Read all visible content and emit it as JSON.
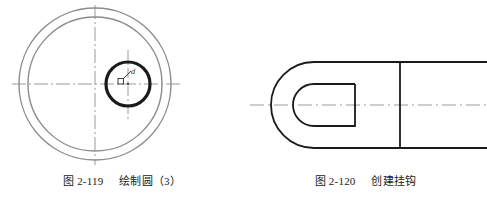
{
  "page": {
    "background_color": "#ffffff",
    "width": 487,
    "height": 197
  },
  "figures": [
    {
      "id": "figure-2-119",
      "caption_number": "图 2-119",
      "caption_title": "绘制圆（3）",
      "description": "两个同心圆与一个粗实线小圆，带点划线中心线",
      "colors": {
        "construction_circle": "#8c8c8c",
        "object_circle": "#1a1a1a",
        "centerline": "#9a9a9a"
      },
      "geometry": {
        "outer_circle": {
          "cx": 95,
          "cy": 84,
          "r": 76,
          "stroke_width": 1.4
        },
        "inner_circle": {
          "cx": 95,
          "cy": 84,
          "r": 67,
          "stroke_width": 1.4
        },
        "small_circle": {
          "cx": 128,
          "cy": 84,
          "r": 22,
          "stroke_width": 3.2
        },
        "horizontal_centerline": {
          "x1": 12,
          "y1": 84,
          "x2": 182,
          "y2": 84
        },
        "vertical_centerline": {
          "x1": 95,
          "y1": 5,
          "x2": 95,
          "y2": 165
        },
        "small_vertical_centerline": {
          "x1": 128,
          "y1": 50,
          "x2": 128,
          "y2": 120
        }
      },
      "snap_marker": {
        "name": "osnap-tooltip",
        "label": "d",
        "x": 120,
        "y": 72
      }
    },
    {
      "id": "figure-2-120",
      "caption_number": "图 2-120",
      "caption_title": "创建挂钩",
      "description": "挂钩轮廓：左端U形弯，内部U形槽，右侧台阶直线段",
      "colors": {
        "object_line": "#1a1a1a",
        "centerline": "#9a9a9a"
      },
      "geometry": {
        "outer_profile_top_y": 62,
        "outer_profile_bottom_y": 148,
        "bend_center_x": 314,
        "bend_outer_radius": 43,
        "bend_inner_radius": 21,
        "inner_slot_top_y": 84,
        "inner_slot_bottom_y": 126,
        "inner_slot_end_x": 355,
        "step_x": 400,
        "right_edge_x": 487,
        "centerline": {
          "x1": 250,
          "y1": 105,
          "x2": 487,
          "y2": 105
        }
      }
    }
  ]
}
